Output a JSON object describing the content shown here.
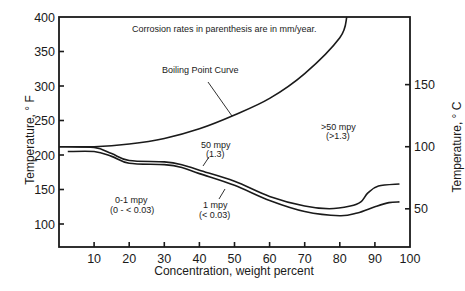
{
  "chart_data": {
    "type": "line",
    "title": "",
    "note": "Corrosion rates in parenthesis are in mm/year.",
    "xlabel": "Concentration, weight percent",
    "ylabel": "Temperature, °F",
    "ylabel_right": "Temperature, °C",
    "xlim": [
      0,
      100
    ],
    "ylim": [
      67,
      400
    ],
    "x_ticks": [
      10,
      20,
      30,
      40,
      50,
      60,
      70,
      80,
      90,
      100
    ],
    "y_ticks": [
      100,
      150,
      200,
      250,
      300,
      350,
      400
    ],
    "y_ticks_right": [
      50,
      100,
      150
    ],
    "grid": false,
    "series": [
      {
        "name": "Boiling Point Curve",
        "x": [
          0,
          10,
          20,
          30,
          40,
          50,
          60,
          70,
          80,
          82
        ],
        "y": [
          212,
          212,
          216,
          224,
          238,
          258,
          282,
          318,
          370,
          400
        ]
      },
      {
        "name": "50 mpy (1.3)",
        "x": [
          0,
          10,
          15,
          20,
          30,
          35,
          40,
          50,
          60,
          70,
          77,
          83,
          86,
          88,
          91,
          97
        ],
        "y": [
          212,
          211,
          202,
          192,
          190,
          186,
          178,
          162,
          140,
          126,
          122,
          126,
          132,
          145,
          155,
          158
        ]
      },
      {
        "name": "1 mpy (< 0.03)",
        "x": [
          2.5,
          10,
          15,
          20,
          30,
          35,
          40,
          50,
          60,
          70,
          80,
          85,
          90,
          94,
          97
        ],
        "y": [
          205,
          205,
          198,
          188,
          186,
          182,
          173,
          156,
          134,
          118,
          112,
          116,
          125,
          131,
          132
        ]
      }
    ],
    "annotations": [
      {
        "text": "Boiling Point Curve",
        "x": 38,
        "y": 330
      },
      {
        "text": "50 mpy",
        "line2": "(1.3)",
        "x": 44,
        "y": 182
      },
      {
        "text": "1 mpy",
        "line2": "(< 0.03)",
        "x": 45,
        "y": 120
      },
      {
        "text": "0-1 mpy",
        "line2": "(0 - < 0.03)",
        "x": 19,
        "y": 140
      },
      {
        "text": ">50 mpy",
        "line2": "(>1.3)",
        "x": 81,
        "y": 265
      }
    ]
  },
  "labels": {
    "note": "Corrosion rates in parenthesis are in mm/year.",
    "boiling": "Boiling Point Curve",
    "r50_a": "50 mpy",
    "r50_b": "(1.3)",
    "r1_a": "1 mpy",
    "r1_b": "(< 0.03)",
    "r01_a": "0-1 mpy",
    "r01_b": "(0 - < 0.03)",
    "rgt50_a": ">50 mpy",
    "rgt50_b": "(>1.3)",
    "xlabel": "Concentration, weight percent",
    "ylabel": "Temperature, ° F",
    "ylabel_right": "Temperature, ° C"
  }
}
